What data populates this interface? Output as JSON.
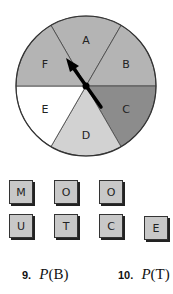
{
  "spinner": {
    "sections": [
      {
        "label": "A",
        "color": "#b4b4b4"
      },
      {
        "label": "B",
        "color": "#b4b4b4"
      },
      {
        "label": "C",
        "color": "#8c8c8c"
      },
      {
        "label": "D",
        "color": "#d2d2d2"
      },
      {
        "label": "E",
        "color": "#ffffff"
      },
      {
        "label": "F",
        "color": "#b4b4b4"
      }
    ],
    "pointer_direction": "toward F/A boundary"
  },
  "tiles": {
    "row1": [
      "M",
      "O",
      "O"
    ],
    "row2": [
      "U",
      "T",
      "C",
      "E"
    ]
  },
  "exercises": [
    {
      "number": "9.",
      "p": "P",
      "arg": "(B)"
    },
    {
      "number": "10.",
      "p": "P",
      "arg": "(T)"
    }
  ]
}
